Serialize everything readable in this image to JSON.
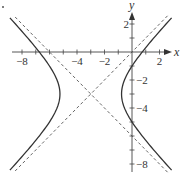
{
  "chart_data": {
    "type": "line",
    "title": "",
    "xlabel": "x",
    "ylabel": "y",
    "xlim": [
      -8.8,
      2.9
    ],
    "ylim": [
      -8.6,
      3.0
    ],
    "grid": false,
    "x_ticks": [
      -8,
      -7,
      -6,
      -5,
      -4,
      -3,
      -2,
      -1,
      1,
      2
    ],
    "y_ticks": [
      2,
      1,
      -1,
      -2,
      -3,
      -4,
      -5,
      -6,
      -7,
      -8
    ],
    "x_tick_labels": [
      {
        "value": -8,
        "label": "−8"
      },
      {
        "value": -4,
        "label": "−4"
      },
      {
        "value": -2,
        "label": "−2"
      },
      {
        "value": 2,
        "label": "2"
      }
    ],
    "y_tick_labels": [
      {
        "value": 2,
        "label": "2"
      },
      {
        "value": -2,
        "label": "−2"
      },
      {
        "value": -4,
        "label": "−4"
      },
      {
        "value": -8,
        "label": "−8"
      }
    ],
    "series": [
      {
        "name": "hyperbola",
        "style": "solid",
        "equation": "(x+3)^2/5 - (y+3)^2/5 = 1",
        "center": [
          -3,
          -3
        ],
        "a": 2.24,
        "b": 2.24,
        "vertices": [
          [
            -5.24,
            -3
          ],
          [
            -0.76,
            -3
          ]
        ]
      },
      {
        "name": "asymptote-1",
        "style": "dashed",
        "equation": "y = x",
        "points": [
          [
            -8.5,
            -8.5
          ],
          [
            2.6,
            2.6
          ]
        ]
      },
      {
        "name": "asymptote-2",
        "style": "dashed",
        "equation": "y = -x - 6",
        "points": [
          [
            -8.5,
            2.5
          ],
          [
            2.6,
            -8.6
          ]
        ]
      }
    ]
  }
}
